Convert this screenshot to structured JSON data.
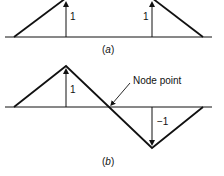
{
  "figure_a": {
    "caption_open": "(",
    "caption_letter": "a",
    "caption_close": ")",
    "left_arrow_label": "1",
    "right_arrow_label": "1"
  },
  "figure_b": {
    "caption_open": "(",
    "caption_letter": "b",
    "caption_close": ")",
    "up_arrow_label": "1",
    "down_arrow_label": "−1",
    "node_label": "Node point"
  },
  "colors": {
    "line": "#111111",
    "background": "#ffffff"
  }
}
